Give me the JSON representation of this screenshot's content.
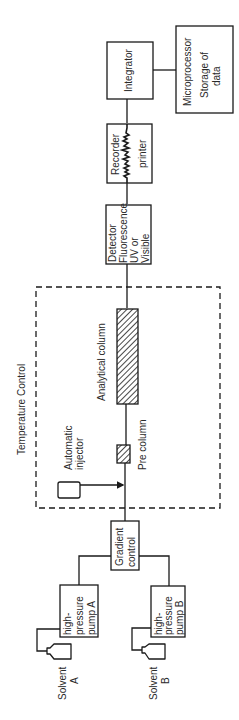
{
  "diagram": {
    "orientation": "rotated 90deg (reads bottom-to-top)",
    "line_color": "#1a1a1a",
    "enclosure": {
      "label": "Temperature Control",
      "style": "dashed"
    },
    "nodes": {
      "solvent_a": {
        "line1": "Solvent",
        "line2": "A"
      },
      "solvent_b": {
        "line1": "Solvent",
        "line2": "B"
      },
      "pump_a": {
        "line1": "high-",
        "line2": "pressure",
        "line3": "pump A"
      },
      "pump_b": {
        "line1": "high-",
        "line2": "pressure",
        "line3": "pump B"
      },
      "gradient": {
        "line1": "Gradient",
        "line2": "control"
      },
      "injector": {
        "line1": "Automatic",
        "line2": "injector"
      },
      "pre_column": {
        "label": "Pre column"
      },
      "analytical_column": {
        "label": "Analytical column"
      },
      "detector": {
        "line1": "Detector",
        "line2": "Fluorescence",
        "line3": "UV or",
        "line4": "Visible"
      },
      "recorder": {
        "line1": "Recorder",
        "line2": "printer"
      },
      "integrator": {
        "label": "Integrator"
      },
      "microprocessor": {
        "line1": "Microprocessor",
        "line2": "Storage of",
        "line3": "data"
      }
    },
    "edges": [
      [
        "solvent_a",
        "pump_a"
      ],
      [
        "solvent_b",
        "pump_b"
      ],
      [
        "pump_a",
        "gradient"
      ],
      [
        "pump_b",
        "gradient"
      ],
      [
        "gradient",
        "pre_column"
      ],
      [
        "injector",
        "pre_column"
      ],
      [
        "pre_column",
        "analytical_column"
      ],
      [
        "analytical_column",
        "detector"
      ],
      [
        "detector",
        "recorder"
      ],
      [
        "recorder",
        "integrator"
      ],
      [
        "integrator",
        "microprocessor"
      ]
    ]
  }
}
